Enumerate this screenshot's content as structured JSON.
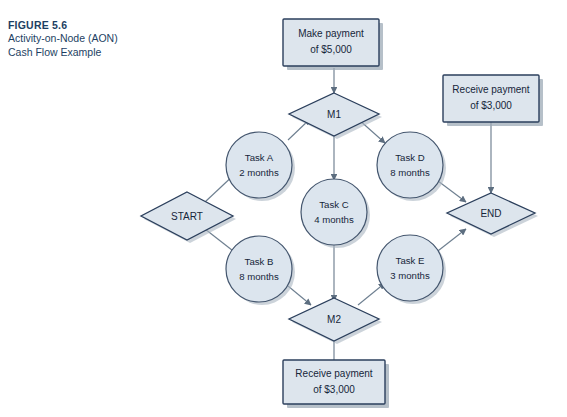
{
  "caption": {
    "figure_number": "FIGURE 5.6",
    "title_line1": "Activity-on-Node (AON)",
    "title_line2": "Cash Flow Example"
  },
  "colors": {
    "shape_fill": "#dde5ed",
    "shape_border": "#2b3f5c",
    "circle_fill": "#dce5ee",
    "circle_border": "#44566e",
    "edge": "#6e7f90",
    "caption_text": "#1d3f63",
    "node_text": "#16263a",
    "shadow": "#9aa7b4",
    "background": "#ffffff"
  },
  "diagram": {
    "type": "activity-on-node-network",
    "nodes": [
      {
        "id": "make_payment",
        "shape": "box",
        "label_line1": "Make payment",
        "label_line2": "of $5,000"
      },
      {
        "id": "receive_right",
        "shape": "box",
        "label_line1": "Receive payment",
        "label_line2": "of $3,000"
      },
      {
        "id": "receive_bottom",
        "shape": "box",
        "label_line1": "Receive payment",
        "label_line2": "of $3,000"
      },
      {
        "id": "start",
        "shape": "diamond",
        "label_line1": "START",
        "label_line2": ""
      },
      {
        "id": "m1",
        "shape": "diamond",
        "label_line1": "M1",
        "label_line2": ""
      },
      {
        "id": "m2",
        "shape": "diamond",
        "label_line1": "M2",
        "label_line2": ""
      },
      {
        "id": "end",
        "shape": "diamond",
        "label_line1": "END",
        "label_line2": ""
      },
      {
        "id": "task_a",
        "shape": "circle",
        "label_line1": "Task A",
        "label_line2": "2 months"
      },
      {
        "id": "task_b",
        "shape": "circle",
        "label_line1": "Task B",
        "label_line2": "8 months"
      },
      {
        "id": "task_c",
        "shape": "circle",
        "label_line1": "Task C",
        "label_line2": "4 months"
      },
      {
        "id": "task_d",
        "shape": "circle",
        "label_line1": "Task D",
        "label_line2": "8 months"
      },
      {
        "id": "task_e",
        "shape": "circle",
        "label_line1": "Task E",
        "label_line2": "3 months"
      }
    ],
    "edges": [
      {
        "from": "start",
        "to": "task_a"
      },
      {
        "from": "start",
        "to": "task_b"
      },
      {
        "from": "task_a",
        "to": "m1"
      },
      {
        "from": "make_payment",
        "to": "m1"
      },
      {
        "from": "m1",
        "to": "task_c"
      },
      {
        "from": "m1",
        "to": "task_d"
      },
      {
        "from": "task_b",
        "to": "m2"
      },
      {
        "from": "task_c",
        "to": "m2"
      },
      {
        "from": "receive_bottom",
        "to": "m2"
      },
      {
        "from": "m2",
        "to": "task_e"
      },
      {
        "from": "task_d",
        "to": "end"
      },
      {
        "from": "task_e",
        "to": "end"
      },
      {
        "from": "receive_right",
        "to": "end"
      }
    ]
  }
}
